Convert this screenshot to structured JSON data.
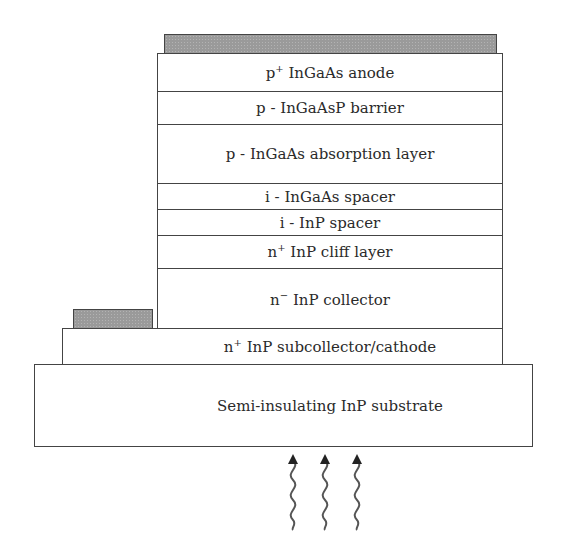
{
  "diagram": {
    "type": "layer-stack cross-section",
    "contacts": {
      "anode_contact": "top metal contact",
      "cathode_contact": "side metal contact"
    },
    "layers": [
      {
        "prefix": "p",
        "sup": "+",
        "text": " InGaAs anode"
      },
      {
        "prefix": "p - InGaAsP barrier",
        "sup": "",
        "text": ""
      },
      {
        "prefix": "p - InGaAs absorption layer",
        "sup": "",
        "text": ""
      },
      {
        "prefix": "i - InGaAs spacer",
        "sup": "",
        "text": ""
      },
      {
        "prefix": "i - InP spacer",
        "sup": "",
        "text": ""
      },
      {
        "prefix": "n",
        "sup": "+",
        "text": " InP cliff layer"
      },
      {
        "prefix": "n",
        "sup": "−",
        "text": " InP collector"
      }
    ],
    "subcollector": {
      "prefix": "n",
      "sup": "+",
      "text": " InP subcollector/cathode"
    },
    "substrate": {
      "text": "Semi-insulating InP substrate"
    },
    "illumination": {
      "direction": "bottom (through substrate)",
      "arrow_count": 3,
      "icon": "wavy-arrow-up"
    }
  }
}
